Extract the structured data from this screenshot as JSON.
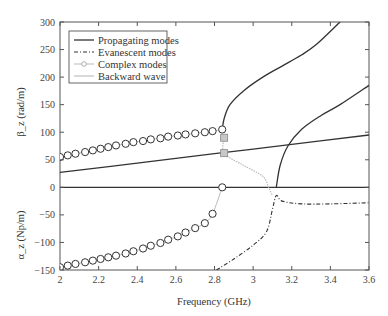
{
  "chart_data": {
    "type": "line",
    "title": "",
    "xlabel": "Frequency (GHz)",
    "ylabel_top": "β_z (rad/m)",
    "ylabel_bottom": "α_z (Np/m)",
    "xlim": [
      2,
      3.6
    ],
    "ylim": [
      -150,
      300
    ],
    "xticks": [
      2,
      2.2,
      2.4,
      2.6,
      2.8,
      3,
      3.2,
      3.4,
      3.6
    ],
    "xtick_labels": [
      "2",
      "2.2",
      "2.4",
      "2.6",
      "2.8",
      "3",
      "3.2",
      "3.4",
      "3.6"
    ],
    "yticks": [
      300,
      250,
      200,
      150,
      100,
      50,
      0,
      -50,
      -100,
      -150
    ],
    "ytick_labels": [
      "300",
      "250",
      "200",
      "150",
      "100",
      "50",
      "0",
      "−50",
      "−100",
      "−150"
    ],
    "grid": false,
    "legend_position": "upper left",
    "legend": [
      {
        "label": "Propagating modes",
        "style": "solid"
      },
      {
        "label": "Evanescent modes",
        "style": "dash-dot"
      },
      {
        "label": "Complex modes",
        "style": "line-circle"
      },
      {
        "label": "Backward wave",
        "style": "dotted-light"
      }
    ],
    "series": [
      {
        "name": "Propagating modes (linear β)",
        "style": "solid",
        "x": [
          2.0,
          2.4,
          2.8,
          3.2,
          3.6
        ],
        "y": [
          27,
          44,
          61,
          78,
          95
        ]
      },
      {
        "name": "Propagating modes (zero line)",
        "style": "solid",
        "x": [
          2.0,
          3.6
        ],
        "y": [
          0,
          0
        ]
      },
      {
        "name": "Propagating modes (upper branch)",
        "style": "solid",
        "x": [
          2.84,
          2.85,
          2.88,
          2.95,
          3.05,
          3.15,
          3.25,
          3.33,
          3.45
        ],
        "y": [
          105,
          125,
          150,
          175,
          200,
          220,
          240,
          260,
          300
        ]
      },
      {
        "name": "Propagating modes (second branch)",
        "style": "solid",
        "x": [
          3.12,
          3.14,
          3.18,
          3.25,
          3.35,
          3.45,
          3.6
        ],
        "y": [
          0,
          40,
          75,
          105,
          130,
          150,
          185
        ]
      },
      {
        "name": "Evanescent modes",
        "style": "dash-dot",
        "x": [
          2.81,
          2.9,
          3.0,
          3.07,
          3.1,
          3.12,
          3.15,
          3.25,
          3.4,
          3.6
        ],
        "y": [
          -150,
          -130,
          -105,
          -80,
          -40,
          -15,
          -25,
          -30,
          -30,
          -28
        ]
      },
      {
        "name": "Complex modes β",
        "style": "line-circle",
        "x": [
          2.0,
          2.04,
          2.08,
          2.13,
          2.17,
          2.21,
          2.25,
          2.29,
          2.34,
          2.38,
          2.43,
          2.47,
          2.52,
          2.56,
          2.61,
          2.65,
          2.7,
          2.75,
          2.79,
          2.84
        ],
        "y": [
          55,
          58,
          61,
          64,
          67,
          70,
          73,
          76,
          79,
          82,
          84,
          87,
          89,
          92,
          94,
          96,
          98,
          100,
          102,
          105
        ]
      },
      {
        "name": "Complex modes α",
        "style": "line-circle",
        "x": [
          2.0,
          2.04,
          2.08,
          2.13,
          2.17,
          2.21,
          2.25,
          2.29,
          2.34,
          2.38,
          2.43,
          2.47,
          2.52,
          2.56,
          2.61,
          2.65,
          2.7,
          2.75,
          2.79,
          2.84
        ],
        "y": [
          -145,
          -142,
          -139,
          -136,
          -133,
          -130,
          -127,
          -124,
          -120,
          -116,
          -111,
          -106,
          -101,
          -95,
          -89,
          -82,
          -74,
          -65,
          -48,
          0
        ]
      },
      {
        "name": "Backward wave",
        "style": "dotted-light",
        "x": [
          2.85,
          2.85,
          2.95,
          3.05,
          3.08,
          3.1
        ],
        "y": [
          90,
          62,
          40,
          20,
          0,
          -15
        ]
      },
      {
        "name": "Backward wave markers",
        "style": "square-marker",
        "x": [
          2.85,
          2.85
        ],
        "y": [
          90,
          62
        ]
      }
    ]
  },
  "colors": {
    "axis": "#555555",
    "propagating": "#333333",
    "evanescent": "#333333",
    "complex": "#333333",
    "complex_line": "#bbbbbb",
    "backward": "#bbbbbb",
    "marker_fill": "#c8c8c8"
  }
}
